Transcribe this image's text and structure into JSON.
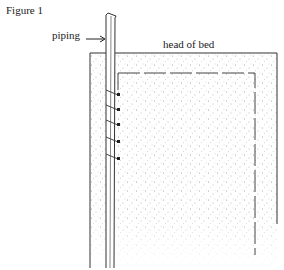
{
  "figure": {
    "title": "Figure 1",
    "labels": {
      "piping": "piping",
      "head_of_bed": "head of bed"
    },
    "elements": {
      "mattress": "stippled mattress outline with dashed inner seam",
      "piping": "vertical piping strip along left side of mattress",
      "ties": 5
    },
    "colors": {
      "line": "#333333",
      "stipple": "#9a9a9a",
      "background": "#ffffff"
    }
  }
}
